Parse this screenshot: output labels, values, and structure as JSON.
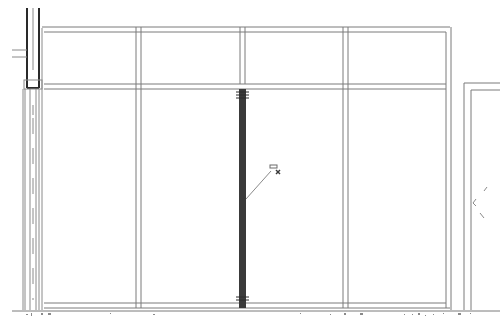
{
  "drawing": {
    "title": "Storefront elevation",
    "background": "#ffffff",
    "line_color": "#7a7a7a",
    "heavy_line_color": "#2a2a2a",
    "selected_mullion_color": "#3a3a3a"
  },
  "frame": {
    "outer_top_y": 28,
    "transom_y": 85,
    "sill_y": 306,
    "left_x": 40,
    "right_x": 450
  },
  "mullions": [
    {
      "id": "m1",
      "x": 138
    },
    {
      "id": "m2",
      "x": 243,
      "selected": true
    },
    {
      "id": "m3",
      "x": 346
    }
  ],
  "panels": {
    "upper_count": 4,
    "lower_count": 4
  },
  "cursor": {
    "type": "pick-cursor",
    "x": 276,
    "y": 169
  },
  "annotations": {
    "ground_marks": [
      "a",
      "a",
      "a",
      "a"
    ]
  }
}
